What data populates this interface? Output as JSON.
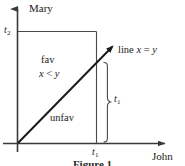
{
  "figure": {
    "caption": "Figure 1",
    "axes": {
      "y_label": "Mary",
      "x_label": "John",
      "y_tick_label": "t",
      "y_tick_sub": "2",
      "x_tick_label": "t",
      "x_tick_sub": "1"
    },
    "regions": {
      "favorable_label": "fav",
      "favorable_condition_lhs": "x",
      "favorable_condition_op": "<",
      "favorable_condition_rhs": "y",
      "unfavorable_label": "unfav"
    },
    "line": {
      "label_prefix": "line ",
      "label_lhs": "x",
      "label_op": " = ",
      "label_rhs": "y"
    },
    "brace": {
      "label": "t",
      "label_sub": "1"
    },
    "colors": {
      "stroke": "#3a3a3a",
      "line": "#1a1a1a",
      "background": "#ffffff",
      "text": "#1a1a1a"
    }
  }
}
